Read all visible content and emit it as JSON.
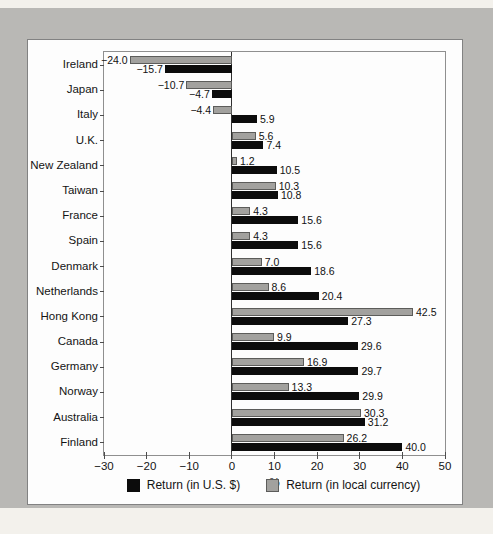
{
  "page": {
    "background_color": "#f3f1ec",
    "backdrop_color": "#b9b8b5",
    "panel_background": "#fdfdfd",
    "panel_border_color": "#828282"
  },
  "chart_data": {
    "type": "bar",
    "orientation": "horizontal",
    "title": "",
    "xlabel": "%",
    "xlim": [
      -30,
      50
    ],
    "xticks": [
      -30,
      -20,
      -10,
      0,
      10,
      20,
      30,
      40,
      50
    ],
    "grid": false,
    "value_labels": true,
    "legend_position": "bottom",
    "group_order_top_to_bottom": [
      "Return (in local currency)",
      "Return (in U.S. $)"
    ],
    "categories": [
      "Ireland",
      "Japan",
      "Italy",
      "U.K.",
      "New Zealand",
      "Taiwan",
      "France",
      "Spain",
      "Denmark",
      "Netherlands",
      "Hong Kong",
      "Canada",
      "Germany",
      "Norway",
      "Australia",
      "Finland"
    ],
    "series": [
      {
        "name": "Return (in U.S. $)",
        "color": "#0c0c0c",
        "values": [
          -15.7,
          -4.7,
          5.9,
          7.4,
          10.5,
          10.8,
          15.6,
          15.6,
          18.6,
          20.4,
          27.3,
          29.6,
          29.7,
          29.9,
          31.2,
          40.0
        ]
      },
      {
        "name": "Return (in local currency)",
        "color": "#a2a19e",
        "values": [
          -24.0,
          -10.7,
          -4.4,
          5.6,
          1.2,
          10.3,
          4.3,
          4.3,
          7.0,
          8.6,
          42.5,
          9.9,
          16.9,
          13.3,
          30.3,
          26.2
        ]
      }
    ]
  }
}
